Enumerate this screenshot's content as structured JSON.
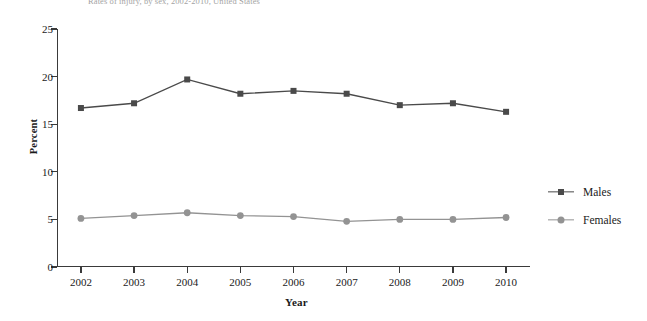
{
  "figure": {
    "clipped_title": "Rates of injury, by sex, 2002-2010, United States"
  },
  "chart_data": {
    "type": "line",
    "title": "",
    "xlabel": "Year",
    "ylabel": "Percent",
    "categories": [
      "2002",
      "2003",
      "2004",
      "2005",
      "2006",
      "2007",
      "2008",
      "2009",
      "2010"
    ],
    "x": [
      2002,
      2003,
      2004,
      2005,
      2006,
      2007,
      2008,
      2009,
      2010
    ],
    "series": [
      {
        "name": "Males",
        "values": [
          16.7,
          17.2,
          19.7,
          18.2,
          18.5,
          18.2,
          17.0,
          17.2,
          16.3
        ],
        "color": "#4a4a4a",
        "marker": "square"
      },
      {
        "name": "Females",
        "values": [
          5.1,
          5.4,
          5.7,
          5.4,
          5.3,
          4.8,
          5.0,
          5.0,
          5.2
        ],
        "color": "#939393",
        "marker": "circle"
      }
    ],
    "ylim": [
      0,
      25
    ],
    "yticks": [
      0,
      5,
      10,
      15,
      20,
      25
    ],
    "xlim": [
      2001.55,
      2010.45
    ],
    "grid": false,
    "legend_position": "right"
  },
  "legend": {
    "entries": [
      {
        "label": "Males"
      },
      {
        "label": "Females"
      }
    ]
  },
  "colors": {
    "males": "#4a4a4a",
    "females": "#939393",
    "axis": "#3a3a3a",
    "background": "#ffffff"
  }
}
